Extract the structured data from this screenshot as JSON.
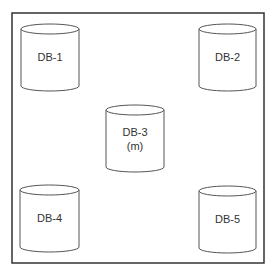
{
  "diagram": {
    "frame": {
      "x": 12,
      "y": 13,
      "width": 252,
      "height": 250,
      "stroke": "#333333"
    },
    "cylinder_stroke": "#555555",
    "nodes": [
      {
        "id": "db1",
        "label": "DB-1",
        "sublabel": "",
        "x": 21,
        "y": 24,
        "w": 58,
        "h": 67
      },
      {
        "id": "db2",
        "label": "DB-2",
        "sublabel": "",
        "x": 199,
        "y": 24,
        "w": 57,
        "h": 67
      },
      {
        "id": "db3",
        "label": "DB-3",
        "sublabel": "(m)",
        "x": 106,
        "y": 105,
        "w": 58,
        "h": 67
      },
      {
        "id": "db4",
        "label": "DB-4",
        "sublabel": "",
        "x": 20,
        "y": 185,
        "w": 59,
        "h": 67
      },
      {
        "id": "db5",
        "label": "DB-5",
        "sublabel": "",
        "x": 199,
        "y": 186,
        "w": 57,
        "h": 67
      }
    ]
  }
}
